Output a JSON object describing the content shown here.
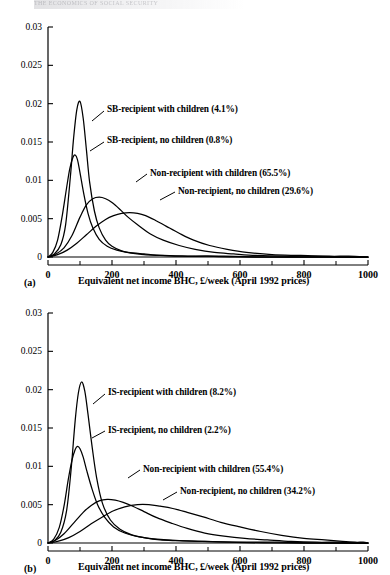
{
  "running_head": "THE ECONOMICS OF SOCIAL SECURITY",
  "figures": [
    {
      "tag": "(a)",
      "xlabel": "Equivalent net income BHC, £/week (April 1992 prices)",
      "ytick_labels": [
        "0",
        "0.005",
        "0.01",
        "0.015",
        "0.02",
        "0.025",
        "0.03"
      ],
      "xtick_labels": [
        "0",
        "200",
        "400",
        "600",
        "800",
        "1000"
      ],
      "annotations": [
        "SB-recipient with children (4.1%)",
        "SB-recipient, no children (0.8%)",
        "Non-recipient with children (65.5%)",
        "Non-recipient, no children (29.6%)"
      ],
      "chart_data": {
        "type": "line",
        "title": "",
        "xlabel": "Equivalent net income BHC, £/week (April 1992 prices)",
        "ylabel": "",
        "xlim": [
          0,
          1000
        ],
        "ylim": [
          0,
          0.03
        ],
        "xticks": [
          0,
          200,
          400,
          600,
          800,
          1000
        ],
        "xminorticks": [
          100,
          300,
          500,
          700,
          900
        ],
        "yticks": [
          0,
          0.005,
          0.01,
          0.015,
          0.02,
          0.025,
          0.03
        ],
        "grid": false,
        "legend": "annotated-inline",
        "series": [
          {
            "name": "SB-recipient with children (4.1%)",
            "share_percent": 4.1,
            "peak_x": 100,
            "peak_y": 0.0203,
            "x": [
              0,
              20,
              40,
              55,
              70,
              80,
              90,
              100,
              110,
              120,
              130,
              145,
              160,
              180,
              200,
              230,
              260,
              300,
              350,
              420,
              500,
              600,
              800,
              1000
            ],
            "y": [
              0.0,
              0.0004,
              0.0016,
              0.0042,
              0.0105,
              0.0155,
              0.0192,
              0.0203,
              0.0181,
              0.014,
              0.0098,
              0.006,
              0.0038,
              0.0022,
              0.0014,
              0.0008,
              0.0005,
              0.0003,
              0.0002,
              0.0001,
              0.0001,
              0.0,
              0.0,
              0.0
            ]
          },
          {
            "name": "SB-recipient, no children (0.8%)",
            "share_percent": 0.8,
            "peak_x": 85,
            "peak_y": 0.0133,
            "x": [
              0,
              15,
              30,
              45,
              58,
              68,
              78,
              85,
              92,
              100,
              112,
              125,
              140,
              160,
              185,
              215,
              250,
              300,
              360,
              440,
              550,
              700,
              850,
              1000
            ],
            "y": [
              0.0,
              0.0006,
              0.0022,
              0.0055,
              0.009,
              0.0115,
              0.013,
              0.0133,
              0.0127,
              0.011,
              0.0082,
              0.0057,
              0.0038,
              0.0023,
              0.0014,
              0.0009,
              0.0006,
              0.0004,
              0.0002,
              0.0001,
              0.0001,
              0.0,
              0.0,
              0.0
            ]
          },
          {
            "name": "Non-recipient with children (65.5%)",
            "share_percent": 65.5,
            "peak_x": 160,
            "peak_y": 0.0078,
            "x": [
              0,
              25,
              50,
              75,
              100,
              120,
              140,
              160,
              180,
              200,
              225,
              250,
              280,
              320,
              360,
              410,
              460,
              520,
              580,
              650,
              740,
              840,
              920,
              1000
            ],
            "y": [
              0.0,
              0.0004,
              0.0012,
              0.0028,
              0.0052,
              0.0068,
              0.0076,
              0.0078,
              0.0076,
              0.0071,
              0.0062,
              0.0052,
              0.0042,
              0.003,
              0.0022,
              0.0015,
              0.001,
              0.0006,
              0.0004,
              0.0002,
              0.0001,
              0.0001,
              0.0,
              0.0
            ]
          },
          {
            "name": "Non-recipient, no children (29.6%)",
            "share_percent": 29.6,
            "peak_x": 255,
            "peak_y": 0.0058,
            "x": [
              0,
              30,
              60,
              90,
              120,
              150,
              180,
              205,
              230,
              255,
              280,
              305,
              335,
              370,
              410,
              455,
              505,
              560,
              620,
              700,
              790,
              880,
              940,
              1000
            ],
            "y": [
              0.0,
              0.0003,
              0.0009,
              0.0018,
              0.0029,
              0.004,
              0.0049,
              0.0054,
              0.0057,
              0.0058,
              0.0057,
              0.0054,
              0.0048,
              0.004,
              0.0031,
              0.0022,
              0.0015,
              0.001,
              0.0006,
              0.0003,
              0.0002,
              0.0001,
              0.0001,
              0.0
            ]
          }
        ]
      }
    },
    {
      "tag": "(b)",
      "xlabel": "Equivalent net income BHC, £/week (April 1992 prices)",
      "ytick_labels": [
        "0",
        "0.005",
        "0.01",
        "0.015",
        "0.02",
        "0.025",
        "0.03"
      ],
      "xtick_labels": [
        "0",
        "200",
        "400",
        "600",
        "800",
        "1000"
      ],
      "annotations": [
        "IS-recipient with children (8.2%)",
        "IS-recipient, no children (2.2%)",
        "Non-recipient with children (55.4%)",
        "Non-recipient, no children (34.2%)"
      ],
      "chart_data": {
        "type": "line",
        "title": "",
        "xlabel": "Equivalent net income BHC, £/week (April 1992 prices)",
        "ylabel": "",
        "xlim": [
          0,
          1000
        ],
        "ylim": [
          0,
          0.03
        ],
        "xticks": [
          0,
          200,
          400,
          600,
          800,
          1000
        ],
        "xminorticks": [
          100,
          300,
          500,
          700,
          900
        ],
        "yticks": [
          0,
          0.005,
          0.01,
          0.015,
          0.02,
          0.025,
          0.03
        ],
        "grid": false,
        "legend": "annotated-inline",
        "series": [
          {
            "name": "IS-recipient with children (8.2%)",
            "share_percent": 8.2,
            "peak_x": 105,
            "peak_y": 0.021,
            "x": [
              0,
              20,
              40,
              58,
              72,
              85,
              95,
              105,
              115,
              125,
              138,
              152,
              170,
              195,
              225,
              260,
              300,
              350,
              410,
              480,
              570,
              700,
              850,
              1000
            ],
            "y": [
              0.0,
              0.0003,
              0.0014,
              0.0042,
              0.0095,
              0.016,
              0.0196,
              0.021,
              0.0198,
              0.0168,
              0.0125,
              0.0085,
              0.0052,
              0.003,
              0.0018,
              0.0011,
              0.0007,
              0.0004,
              0.0003,
              0.0002,
              0.0001,
              0.0,
              0.0,
              0.0
            ]
          },
          {
            "name": "IS-recipient, no children (2.2%)",
            "share_percent": 2.2,
            "peak_x": 92,
            "peak_y": 0.0126,
            "x": [
              0,
              18,
              35,
              50,
              63,
              75,
              85,
              92,
              100,
              110,
              122,
              138,
              155,
              178,
              205,
              240,
              285,
              340,
              410,
              490,
              590,
              720,
              860,
              1000
            ],
            "y": [
              0.0,
              0.0005,
              0.002,
              0.0048,
              0.0082,
              0.0108,
              0.0122,
              0.0126,
              0.0123,
              0.0112,
              0.0093,
              0.007,
              0.005,
              0.0033,
              0.0021,
              0.0013,
              0.0008,
              0.0005,
              0.0003,
              0.0002,
              0.0001,
              0.0001,
              0.0,
              0.0
            ]
          },
          {
            "name": "Non-recipient with children (55.4%)",
            "share_percent": 55.4,
            "peak_x": 185,
            "peak_y": 0.0057,
            "x": [
              0,
              25,
              50,
              80,
              110,
              135,
              160,
              185,
              210,
              235,
              265,
              300,
              340,
              385,
              435,
              490,
              550,
              615,
              685,
              760,
              840,
              910,
              960,
              1000
            ],
            "y": [
              0.0,
              0.0004,
              0.0012,
              0.0026,
              0.004,
              0.0049,
              0.0055,
              0.0057,
              0.0056,
              0.0053,
              0.0048,
              0.0041,
              0.0033,
              0.0026,
              0.0019,
              0.0013,
              0.0009,
              0.0006,
              0.0004,
              0.0002,
              0.0001,
              0.0001,
              0.0,
              0.0
            ]
          },
          {
            "name": "Non-recipient, no children (34.2%)",
            "share_percent": 34.2,
            "peak_x": 280,
            "peak_y": 0.005,
            "x": [
              0,
              30,
              65,
              100,
              135,
              170,
              205,
              240,
              280,
              315,
              350,
              390,
              435,
              485,
              540,
              600,
              665,
              730,
              800,
              865,
              920,
              960,
              985,
              1000
            ],
            "y": [
              0.0,
              0.0002,
              0.0007,
              0.0015,
              0.0025,
              0.0034,
              0.0042,
              0.0047,
              0.005,
              0.005,
              0.0048,
              0.0045,
              0.004,
              0.0034,
              0.0027,
              0.0021,
              0.0015,
              0.001,
              0.0006,
              0.0004,
              0.0002,
              0.0001,
              0.0001,
              0.0
            ]
          }
        ]
      }
    }
  ]
}
